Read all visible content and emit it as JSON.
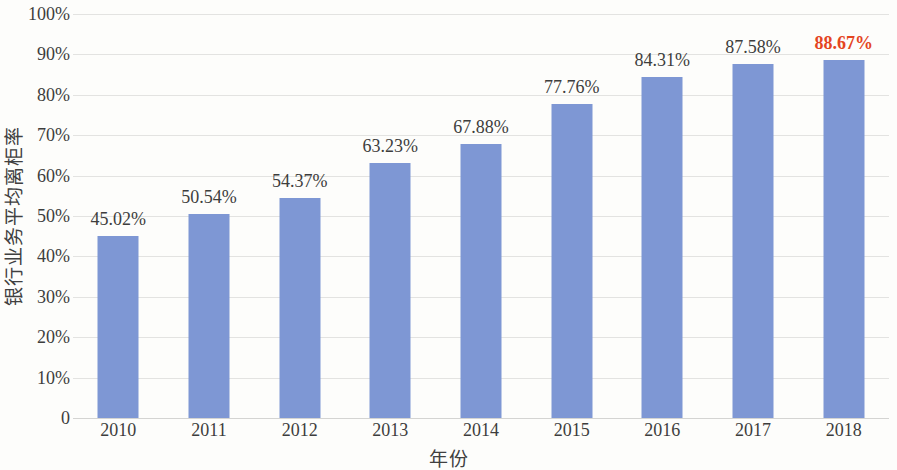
{
  "chart_data": {
    "type": "bar",
    "title": "",
    "subtitle": "",
    "xlabel": "年份",
    "ylabel": "银行业务平均离柜率",
    "categories": [
      "2010",
      "2011",
      "2012",
      "2013",
      "2014",
      "2015",
      "2016",
      "2017",
      "2018"
    ],
    "values": [
      45.02,
      50.54,
      54.37,
      63.23,
      67.88,
      77.76,
      84.31,
      87.58,
      88.67
    ],
    "data_labels": [
      "45.02%",
      "50.54%",
      "54.37%",
      "63.23%",
      "67.88%",
      "77.76%",
      "84.31%",
      "87.58%",
      "88.67%"
    ],
    "series": [
      {
        "name": "银行业务平均离柜率",
        "values": [
          45.02,
          50.54,
          54.37,
          63.23,
          67.88,
          77.76,
          84.31,
          87.58,
          88.67
        ]
      }
    ],
    "ylim": [
      0,
      100
    ],
    "y_ticks": [
      0,
      10,
      20,
      30,
      40,
      50,
      60,
      70,
      80,
      90,
      100
    ],
    "y_tick_labels": [
      "0",
      "10%",
      "20%",
      "30%",
      "40%",
      "50%",
      "60%",
      "70%",
      "80%",
      "90%",
      "100%"
    ],
    "grid": true,
    "grid_axis": "y",
    "legend": false,
    "legend_position": "none",
    "unit": "%",
    "highlight_index": 8,
    "colors": {
      "bar": "#7e97d4",
      "highlight_label": "#e4451f",
      "gridline": "#e3e3e1",
      "text": "#3d3d3d",
      "background": "#fdfdfb"
    }
  }
}
